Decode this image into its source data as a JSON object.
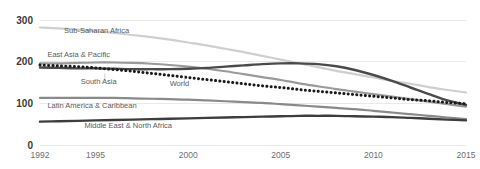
{
  "chart_data": {
    "type": "line",
    "title": "",
    "subtitle": "",
    "xlabel": "",
    "ylabel": "",
    "grid": "horizontal",
    "legend_position": "inline-labels",
    "xlim": [
      1992,
      2015
    ],
    "ylim": [
      0,
      300
    ],
    "x": [
      1992,
      1993,
      1994,
      1995,
      1996,
      1997,
      1998,
      1999,
      2000,
      2001,
      2002,
      2003,
      2004,
      2005,
      2006,
      2007,
      2008,
      2009,
      2010,
      2011,
      2012,
      2013,
      2014,
      2015
    ],
    "xticks": [
      1992,
      1995,
      2000,
      2005,
      2010,
      2015
    ],
    "xtick_labels": [
      "1992",
      "1995",
      "2000",
      "2005",
      "2010",
      "2015"
    ],
    "yticks": [
      0,
      100,
      200,
      300
    ],
    "ytick_labels": [
      "0",
      "100",
      "200",
      "300"
    ],
    "series": [
      {
        "name": "Sub-Saharan Africa",
        "color": "#cfcfcf",
        "style": "solid",
        "width": 2.2,
        "label_x": 1993.3,
        "label_y": 268,
        "values": [
          282,
          280,
          277,
          273,
          269,
          264,
          259,
          253,
          246,
          239,
          231,
          223,
          214,
          205,
          196,
          187,
          178,
          170,
          162,
          154,
          147,
          139,
          132,
          126
        ]
      },
      {
        "name": "East Asia & Pacific",
        "color": "#9a9a9a",
        "style": "solid",
        "width": 2.2,
        "label_x": 1992.4,
        "label_y": 211,
        "values": [
          196,
          196,
          197,
          198,
          198,
          197,
          195,
          192,
          188,
          183,
          177,
          170,
          163,
          156,
          148,
          141,
          134,
          128,
          122,
          116,
          110,
          104,
          98,
          92
        ]
      },
      {
        "name": "South Asia",
        "color": "#4a4a4a",
        "style": "solid",
        "width": 2.4,
        "label_x": 1994.2,
        "label_y": 146,
        "values": [
          186,
          185,
          184,
          184,
          183,
          182,
          182,
          182,
          183,
          185,
          188,
          191,
          194,
          196,
          196,
          194,
          189,
          180,
          168,
          154,
          138,
          122,
          107,
          96
        ]
      },
      {
        "name": "World",
        "color": "#1a1a1a",
        "style": "dotted",
        "width": 2.6,
        "label_x": 1999.0,
        "label_y": 142,
        "values": [
          192,
          190,
          188,
          185,
          181,
          177,
          172,
          167,
          162,
          157,
          152,
          147,
          142,
          138,
          133,
          129,
          125,
          121,
          117,
          113,
          109,
          106,
          102,
          99
        ]
      },
      {
        "name": "Latin America & Caribbean",
        "color": "#8a8a8a",
        "style": "solid",
        "width": 2.2,
        "label_x": 1992.4,
        "label_y": 88,
        "values": [
          113,
          113,
          113,
          113,
          113,
          112,
          111,
          110,
          109,
          107,
          105,
          103,
          101,
          98,
          95,
          92,
          89,
          86,
          82,
          78,
          74,
          70,
          66,
          62
        ]
      },
      {
        "name": "Middle East & North Africa",
        "color": "#3d3d3d",
        "style": "solid",
        "width": 2.4,
        "label_x": 1994.4,
        "label_y": 40,
        "values": [
          56,
          57,
          58,
          59,
          60,
          61,
          62,
          63,
          64,
          65,
          66,
          67,
          68,
          69,
          70,
          70,
          70,
          69,
          68,
          67,
          65,
          63,
          61,
          59
        ]
      }
    ],
    "annotations": [
      {
        "text": "South Asia",
        "leader_from": [
          1995.5,
          172
        ],
        "leader_to": [
          1995.5,
          152
        ]
      },
      {
        "text": "World",
        "leader_from": [
          1999.8,
          168
        ],
        "leader_to": [
          1999.8,
          148
        ]
      }
    ]
  }
}
